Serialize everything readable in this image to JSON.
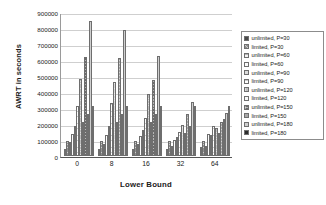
{
  "chart_data": {
    "type": "bar",
    "title": "",
    "xlabel": "Lower Bound",
    "ylabel": "AWRT in seconds",
    "categories": [
      "0",
      "8",
      "16",
      "32",
      "64"
    ],
    "ylim": [
      0,
      900000
    ],
    "ytick_values": [
      900000,
      800000,
      700000,
      600000,
      500000,
      400000,
      300000,
      200000,
      100000,
      0
    ],
    "ytick_labels": [
      "900000",
      "800000",
      "700000",
      "600000",
      "500000",
      "400000",
      "300000",
      "200000",
      "100000",
      "0"
    ],
    "grid": true,
    "legend_position": "right",
    "series": [
      {
        "name": "unlimited, P=30",
        "values": [
          45000,
          45000,
          42000,
          45000,
          55000
        ]
      },
      {
        "name": "limited, P=30",
        "values": [
          95000,
          95000,
          93000,
          95000,
          95000
        ]
      },
      {
        "name": "unlimited, P=60",
        "values": [
          85000,
          75000,
          72000,
          60000,
          65000
        ]
      },
      {
        "name": "limited, P=60",
        "values": [
          140000,
          130000,
          125000,
          100000,
          140000
        ]
      },
      {
        "name": "unlimited, P=90",
        "values": [
          190000,
          185000,
          160000,
          120000,
          130000
        ]
      },
      {
        "name": "limited, P=90",
        "values": [
          310000,
          330000,
          240000,
          150000,
          190000
        ]
      },
      {
        "name": "unlimited, P=120",
        "values": [
          480000,
          460000,
          390000,
          195000,
          175000
        ]
      },
      {
        "name": "limited, P=120",
        "values": [
          215000,
          215000,
          215000,
          145000,
          145000
        ]
      },
      {
        "name": "unlimited, P=150",
        "values": [
          620000,
          612000,
          472000,
          265000,
          215000
        ]
      },
      {
        "name": "limited, P=150",
        "values": [
          260000,
          265000,
          265000,
          190000,
          230000
        ]
      },
      {
        "name": "unlimited, P=180",
        "values": [
          845000,
          785000,
          622000,
          340000,
          270000
        ]
      },
      {
        "name": "limited, P=180",
        "values": [
          310000,
          310000,
          310000,
          310000,
          312000
        ]
      }
    ]
  }
}
